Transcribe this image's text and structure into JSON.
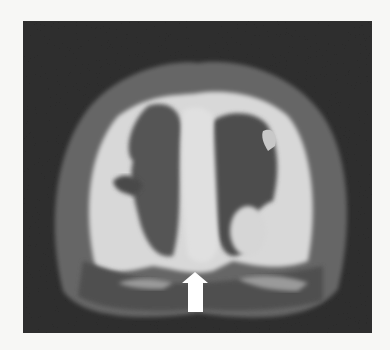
{
  "image": {
    "kind": "grayscale medical rendering",
    "colors": {
      "page_background": "#f7f7f5",
      "frame_background": "#2e2e2e",
      "outer_tissue": "#6a6a6a",
      "bright_tissue": "#dcdcdc",
      "dark_region": "#4a4a4a",
      "arrow": "#ffffff"
    },
    "annotation": {
      "type": "arrow",
      "direction": "up",
      "icon": "arrow-up-icon"
    }
  }
}
